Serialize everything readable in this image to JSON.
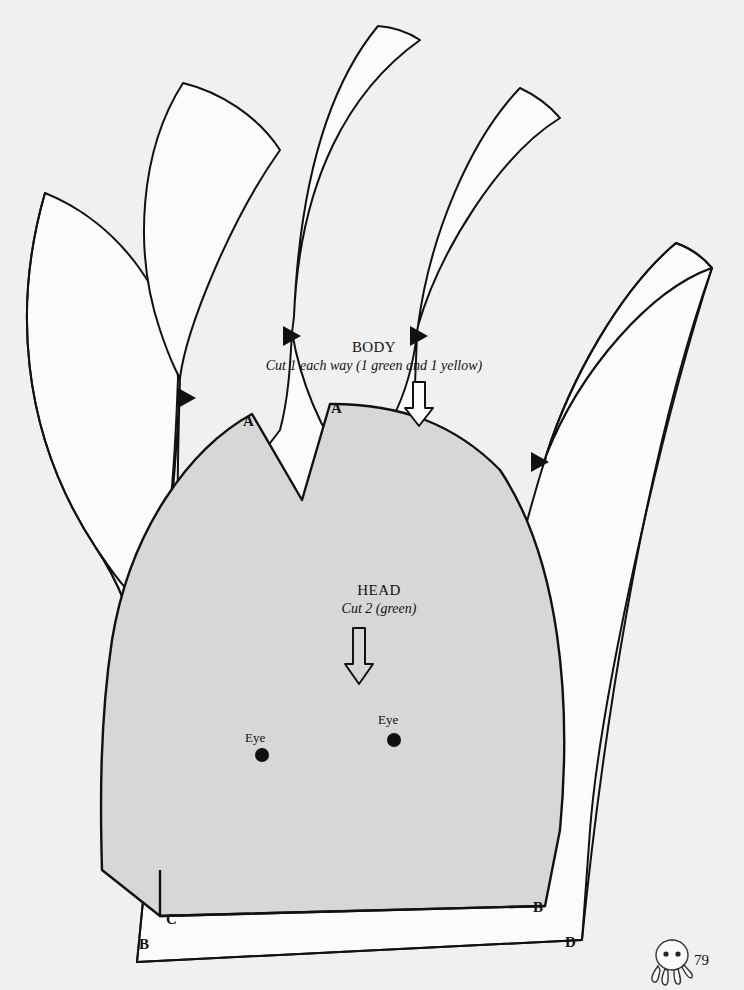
{
  "page": {
    "background_color": "#f0f0f0",
    "ink_color": "#111111",
    "head_fill_color": "#d7d7d7",
    "piece_fill_color": "#fbfbfb",
    "number": "79"
  },
  "pieces": {
    "body": {
      "title": "BODY",
      "instruction": "Cut 1 each way (1 green and 1 yellow)",
      "grainline": "grainline-arrow-down",
      "corner_labels": [
        "B",
        "D"
      ],
      "petal_count": 5,
      "tip_marker": "triangle-marker"
    },
    "head": {
      "title": "HEAD",
      "instruction": "Cut 2 (green)",
      "grainline": "grainline-arrow-down",
      "notch_labels": [
        "A",
        "A"
      ],
      "corner_labels": [
        "C",
        "B"
      ],
      "eyes": [
        {
          "label": "Eye"
        },
        {
          "label": "Eye"
        }
      ]
    }
  },
  "footer": {
    "page_number": "79",
    "mascot": "octopus-icon"
  }
}
